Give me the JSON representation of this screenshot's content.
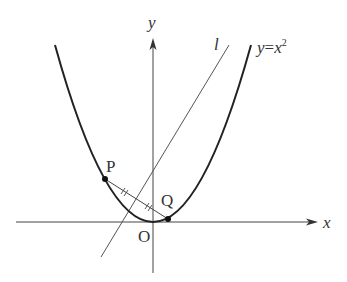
{
  "diagram": {
    "labels": {
      "y_axis": "y",
      "x_axis": "x",
      "origin": "O",
      "line": "l",
      "curve_lhs": "y",
      "curve_eq": "=",
      "curve_rhs": "x",
      "curve_exp": "2",
      "point_p": "P",
      "point_q": "Q"
    },
    "curve": "y = x^2",
    "points": [
      "P",
      "Q"
    ]
  }
}
